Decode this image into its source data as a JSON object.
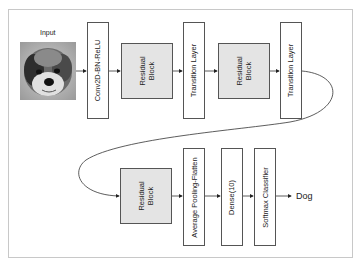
{
  "diagram": {
    "input_label": "Input",
    "input_image_icon": "dog-photo",
    "row1": [
      {
        "id": "conv",
        "label": "Conv2D-BN-ReLU",
        "type": "layer"
      },
      {
        "id": "res1",
        "label_line1": "Residual",
        "label_line2": "Block",
        "type": "residual"
      },
      {
        "id": "trans1",
        "label": "Transition Layer",
        "type": "layer"
      },
      {
        "id": "res2",
        "label_line1": "Residual",
        "label_line2": "Block",
        "type": "residual"
      },
      {
        "id": "trans2",
        "label": "Transition Layer",
        "type": "layer"
      }
    ],
    "row2": [
      {
        "id": "res3",
        "label_line1": "Residual",
        "label_line2": "Block",
        "type": "residual"
      },
      {
        "id": "avgpool",
        "label": "Average Pooling-Flatten",
        "type": "layer"
      },
      {
        "id": "dense",
        "label": "Dense(10)",
        "type": "layer"
      },
      {
        "id": "softmax",
        "label": "Softmax Classifier",
        "type": "layer"
      }
    ],
    "output_label": "Dog",
    "colors": {
      "residual_fill": "#e4e4e4",
      "layer_fill": "#ffffff",
      "stroke": "#555555",
      "frame": "#c8c8c8"
    }
  }
}
